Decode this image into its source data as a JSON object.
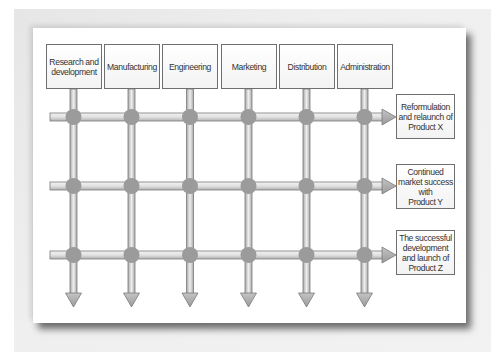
{
  "diagram": {
    "type": "matrix-organization",
    "departments": [
      {
        "label": "Research and\ndevelopment"
      },
      {
        "label": "Manufacturing"
      },
      {
        "label": "Engineering"
      },
      {
        "label": "Marketing"
      },
      {
        "label": "Distribution"
      },
      {
        "label": "Administration"
      }
    ],
    "outcomes": [
      {
        "label": "Reformulation\nand relaunch of\nProduct X"
      },
      {
        "label": "Continued\nmarket success\nwith\nProduct Y"
      },
      {
        "label": "The successful\ndevelopment\nand launch of\nProduct Z"
      }
    ]
  },
  "colors": {
    "bar_edge": "#7a7a7a",
    "bar_light": "#eeeeee",
    "bar_dark": "#a8a8a8",
    "node": "#9b9b9b",
    "box_border": "#6f6f6f",
    "text": "#333333"
  }
}
